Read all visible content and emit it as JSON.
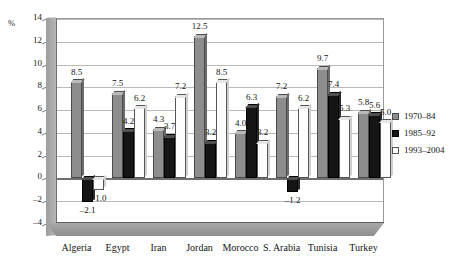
{
  "chart_data": {
    "type": "bar",
    "title": "",
    "subtitle": "",
    "xlabel": "",
    "ylabel": "%",
    "ylim": [
      -4,
      14
    ],
    "yticks": [
      14,
      12,
      10,
      8,
      6,
      4,
      2,
      0,
      -2,
      -4
    ],
    "ytick_labels": [
      "14",
      "12",
      "10",
      "8",
      "6",
      "4",
      "2",
      "0",
      "–2",
      "–4"
    ],
    "grid": true,
    "legend_position": "right",
    "categories": [
      "Algeria",
      "Egypt",
      "Iran",
      "Jordan",
      "Morocco",
      "S. Arabia",
      "Tunisia",
      "Turkey"
    ],
    "series": [
      {
        "name": "1970–84",
        "color": "#8d8d8d",
        "values": [
          8.5,
          7.5,
          4.3,
          12.5,
          4.0,
          7.2,
          9.7,
          5.8
        ],
        "labels": [
          "8.5",
          "7.5",
          "4.3",
          "12.5",
          "4.0",
          "7.2",
          "9.7",
          "5.8"
        ]
      },
      {
        "name": "1985–92",
        "color": "#151515",
        "values": [
          -2.1,
          4.2,
          3.7,
          3.2,
          6.3,
          -1.2,
          7.4,
          5.6
        ],
        "labels": [
          "–2.1",
          "4.2",
          "3.7",
          "3.2",
          "6.3",
          "–1.2",
          "7.4",
          "5.6"
        ]
      },
      {
        "name": "1993–2004",
        "color": "#fdfdfd",
        "values": [
          -1.0,
          6.2,
          7.2,
          8.5,
          3.2,
          6.2,
          5.3,
          5.0
        ],
        "labels": [
          "–1.0",
          "6.2",
          "7.2",
          "8.5",
          "3.2",
          "6.2",
          "5.3",
          "5.0"
        ]
      }
    ]
  },
  "axis": {
    "unit_label": "%"
  },
  "legend": {
    "items": [
      {
        "label": "1970–84"
      },
      {
        "label": "1985–92"
      },
      {
        "label": "1993–2004"
      }
    ]
  }
}
